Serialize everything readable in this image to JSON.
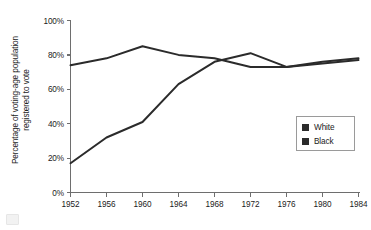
{
  "chart_data": {
    "type": "line",
    "title": "",
    "xlabel": "",
    "ylabel": "Percentage of voting-age population registered to vote",
    "ylabel_line1": "Percentage of voting-age population",
    "ylabel_line2": "registered to vote",
    "categories": [
      "1952",
      "1956",
      "1960",
      "1964",
      "1968",
      "1972",
      "1976",
      "1980",
      "1984"
    ],
    "x": [
      1952,
      1956,
      1960,
      1964,
      1968,
      1972,
      1976,
      1980,
      1984
    ],
    "series": [
      {
        "name": "White",
        "color": "#2b2b2b",
        "values": [
          74,
          78,
          85,
          80,
          78,
          73,
          73,
          76,
          78
        ]
      },
      {
        "name": "Black",
        "color": "#2b2b2b",
        "values": [
          17,
          32,
          41,
          63,
          76,
          81,
          73,
          75,
          77
        ]
      }
    ],
    "ylim": [
      0,
      100
    ],
    "yticks": [
      0,
      20,
      40,
      60,
      80,
      100
    ],
    "ytick_labels": [
      "0%",
      "20%",
      "40%",
      "60%",
      "80%",
      "100%"
    ],
    "xlim": [
      1952,
      1984
    ],
    "grid": false,
    "legend_position": "center-right",
    "axis_color": "#6e6e6e",
    "text_color": "#1b1b1b",
    "background": "#ffffff"
  },
  "legend": {
    "items": [
      {
        "label": "White",
        "swatch_color": "#2b2b2b"
      },
      {
        "label": "Black",
        "swatch_color": "#2b2b2b"
      }
    ]
  }
}
